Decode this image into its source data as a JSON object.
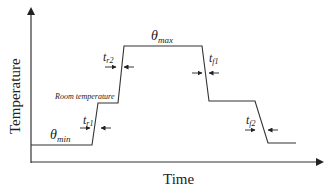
{
  "diagram": {
    "type": "temperature-time profile",
    "axes": {
      "x_label": "Time",
      "y_label": "Temperature"
    },
    "levels": {
      "min": {
        "symbol": "θ",
        "subscript": "min"
      },
      "max": {
        "symbol": "θ",
        "subscript": "max"
      },
      "room": {
        "label": "Room temperature"
      }
    },
    "transitions": [
      {
        "symbol": "t",
        "subscript": "r1"
      },
      {
        "symbol": "t",
        "subscript": "r2"
      },
      {
        "symbol": "t",
        "subscript": "f1"
      },
      {
        "symbol": "t",
        "subscript": "f2"
      }
    ],
    "colors": {
      "line": "#333333",
      "background": "#ffffff"
    }
  }
}
